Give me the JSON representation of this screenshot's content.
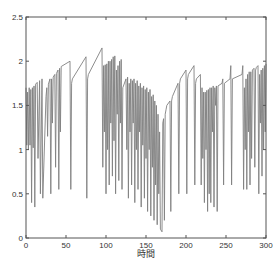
{
  "chart_data": {
    "type": "line",
    "title": "",
    "xlabel": "時間",
    "ylabel": "",
    "xlim": [
      0,
      300
    ],
    "ylim": [
      0,
      2.5
    ],
    "xticks": [
      0,
      50,
      100,
      150,
      200,
      250,
      300
    ],
    "yticks": [
      0,
      0.5,
      1,
      1.5,
      2,
      2.5
    ],
    "grid": false,
    "legend": null,
    "line_color": "#808080",
    "series": [
      {
        "name": "series1",
        "x": [
          0,
          1,
          2,
          3,
          4,
          5,
          6,
          7,
          8,
          9,
          10,
          11,
          12,
          14,
          15,
          17,
          18,
          20,
          21,
          25,
          26,
          27,
          28,
          30,
          31,
          32,
          33,
          34,
          36,
          37,
          38,
          40,
          41,
          42,
          43,
          44,
          55,
          56,
          57,
          58,
          75,
          76,
          77,
          78,
          95,
          96,
          97,
          98,
          99,
          100,
          101,
          102,
          103,
          104,
          105,
          106,
          107,
          108,
          109,
          110,
          111,
          112,
          113,
          114,
          115,
          116,
          117,
          118,
          119,
          120,
          121,
          125,
          126,
          127,
          128,
          129,
          130,
          131,
          132,
          133,
          134,
          135,
          136,
          137,
          138,
          139,
          140,
          141,
          142,
          143,
          144,
          145,
          146,
          147,
          148,
          149,
          150,
          151,
          152,
          153,
          154,
          155,
          156,
          157,
          158,
          159,
          160,
          161,
          162,
          163,
          164,
          165,
          166,
          167,
          168,
          170,
          171,
          172,
          173,
          174,
          175,
          176,
          180,
          181,
          182,
          183,
          190,
          191,
          192,
          193,
          200,
          201,
          202,
          203,
          210,
          211,
          212,
          213,
          218,
          219,
          220,
          221,
          222,
          223,
          224,
          225,
          226,
          227,
          228,
          229,
          230,
          231,
          232,
          233,
          234,
          235,
          236,
          237,
          238,
          239,
          240,
          245,
          246,
          247,
          248,
          255,
          256,
          257,
          258,
          270,
          271,
          272,
          273,
          274,
          275,
          276,
          277,
          278,
          279,
          280,
          281,
          282,
          283,
          285,
          286,
          287,
          288,
          290,
          291,
          292,
          293,
          294,
          295,
          296,
          297,
          298,
          299,
          300
        ],
        "y": [
          1.7,
          1.05,
          1.65,
          1.0,
          1.7,
          1.05,
          1.68,
          0.4,
          1.7,
          1.02,
          1.72,
          0.35,
          1.74,
          1.76,
          0.9,
          1.78,
          0.5,
          1.8,
          0.45,
          1.6,
          1.7,
          1.15,
          1.74,
          1.8,
          0.5,
          1.8,
          1.3,
          1.82,
          1.85,
          0.8,
          1.86,
          1.9,
          0.55,
          1.92,
          1.2,
          1.94,
          2.0,
          0.55,
          1.75,
          1.8,
          2.05,
          0.45,
          1.8,
          1.85,
          2.15,
          0.8,
          1.95,
          1.2,
          1.96,
          0.5,
          1.97,
          1.0,
          2.0,
          0.6,
          2.0,
          1.3,
          2.02,
          0.7,
          2.05,
          1.1,
          2.06,
          0.5,
          1.9,
          1.4,
          1.95,
          0.65,
          2.0,
          1.3,
          2.02,
          0.55,
          1.7,
          1.8,
          1.0,
          1.82,
          0.45,
          1.75,
          1.2,
          1.8,
          0.6,
          1.78,
          1.3,
          1.8,
          0.4,
          1.75,
          1.0,
          1.78,
          0.55,
          1.72,
          1.2,
          1.75,
          0.35,
          1.7,
          1.05,
          1.72,
          0.45,
          1.68,
          0.9,
          1.7,
          0.3,
          1.65,
          1.0,
          1.68,
          0.25,
          1.6,
          0.8,
          1.62,
          0.2,
          1.55,
          0.6,
          1.5,
          0.15,
          1.4,
          0.5,
          1.2,
          0.1,
          0.07,
          1.3,
          1.35,
          0.2,
          1.4,
          1.45,
          1.5,
          1.55,
          0.3,
          1.55,
          1.6,
          1.75,
          0.5,
          1.75,
          1.8,
          1.9,
          0.5,
          1.8,
          1.85,
          1.95,
          0.6,
          1.75,
          1.8,
          1.85,
          0.6,
          1.7,
          0.9,
          1.65,
          0.4,
          1.65,
          1.0,
          1.67,
          0.3,
          1.68,
          0.5,
          1.7,
          0.4,
          1.7,
          1.2,
          1.72,
          0.35,
          1.7,
          1.5,
          1.72,
          0.3,
          1.72,
          1.75,
          1.8,
          0.6,
          1.75,
          1.8,
          1.95,
          0.6,
          1.8,
          1.85,
          1.95,
          0.55,
          1.7,
          1.0,
          1.8,
          0.55,
          1.85,
          1.2,
          1.88,
          0.6,
          1.88,
          0.9,
          1.9,
          1.92,
          0.8,
          1.9,
          1.93,
          1.95,
          0.5,
          1.85,
          1.3,
          1.9,
          0.7,
          1.92,
          1.0,
          1.95,
          1.2,
          1.97
        ]
      }
    ]
  },
  "axes": {
    "xlabel": "時間",
    "xtick_labels": [
      "0",
      "50",
      "100",
      "150",
      "200",
      "250",
      "300"
    ],
    "ytick_labels": [
      "0",
      "0.5",
      "1",
      "1.5",
      "2",
      "2.5"
    ]
  }
}
